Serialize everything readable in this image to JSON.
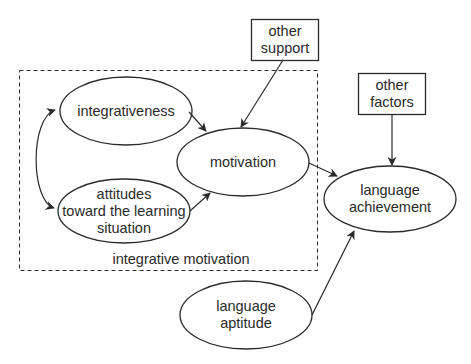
{
  "diagram": {
    "type": "flow-diagram",
    "group": {
      "label": "integrative motivation",
      "style": "dashed"
    },
    "nodes": {
      "integrativeness": {
        "lines": [
          "integrativeness"
        ],
        "shape": "ellipse"
      },
      "attitudes": {
        "lines": [
          "attitudes",
          "toward the learning",
          "situation"
        ],
        "shape": "ellipse"
      },
      "motivation": {
        "lines": [
          "motivation"
        ],
        "shape": "ellipse"
      },
      "other_support": {
        "lines": [
          "other",
          "support"
        ],
        "shape": "rectangle"
      },
      "other_factors": {
        "lines": [
          "other",
          "factors"
        ],
        "shape": "rectangle"
      },
      "language_achievement": {
        "lines": [
          "language",
          "achievement"
        ],
        "shape": "ellipse"
      },
      "language_aptitude": {
        "lines": [
          "language",
          "aptitude"
        ],
        "shape": "ellipse"
      }
    },
    "edges": [
      {
        "from": "integrativeness",
        "to": "attitudes",
        "bidirectional": true
      },
      {
        "from": "integrativeness",
        "to": "motivation"
      },
      {
        "from": "attitudes",
        "to": "motivation"
      },
      {
        "from": "other_support",
        "to": "motivation"
      },
      {
        "from": "motivation",
        "to": "language_achievement"
      },
      {
        "from": "other_factors",
        "to": "language_achievement"
      },
      {
        "from": "language_aptitude",
        "to": "language_achievement"
      }
    ],
    "colors": {
      "stroke": "#2a2a2a",
      "background": "#ffffff"
    }
  }
}
